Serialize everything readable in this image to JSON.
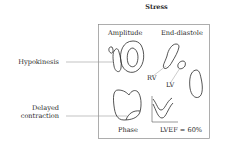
{
  "title": "Stress",
  "panel": {
    "amplitude_label": "Amplitude",
    "end_diastole_label": "End-diastole",
    "rv_label": "RV",
    "lv_label": "LV",
    "phase_label": "Phase",
    "lvef_label": "LVEF = 60%"
  },
  "annotations": {
    "hypokinesis": "Hypokinesis",
    "delayed_line1": "Delayed",
    "delayed_line2": "contraction"
  },
  "colors": {
    "stroke": "#2a2a2a",
    "leader_line": "#9a9a9a",
    "frame": "#8a8a8a",
    "background": "#ffffff"
  }
}
